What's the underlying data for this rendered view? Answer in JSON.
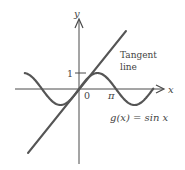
{
  "figure": {
    "colors": {
      "background": "#ffffff",
      "stroke": "#505050",
      "text": "#444444"
    }
  },
  "axes": {
    "x_label": "x",
    "y_label": "y",
    "origin_label": "0",
    "y_tick_label": "1",
    "x_tick_label": "π"
  },
  "annotations": {
    "tangent_line_1": "Tangent",
    "tangent_line_2": "line",
    "function_label": "g(x) = sin x"
  },
  "chart_data": {
    "type": "line",
    "title": "",
    "xlabel": "x",
    "ylabel": "y",
    "series": [
      {
        "name": "g(x) = sin x",
        "function": "sin(x)",
        "x_range": [
          -4.6,
          6.3
        ],
        "x": [
          -4.6,
          -3.14159,
          -1.5708,
          0,
          1.5708,
          3.14159,
          4.71239,
          6.2
        ],
        "y": [
          0.99,
          0,
          -1,
          0,
          1,
          0,
          -1,
          -0.08
        ]
      },
      {
        "name": "Tangent line",
        "function": "y = x",
        "x_range": [
          -4.3,
          3.8
        ],
        "x": [
          -4.3,
          3.8
        ],
        "y": [
          -4.0,
          3.6
        ]
      }
    ],
    "x_ticks": [
      {
        "value": 3.14159,
        "label": "π"
      }
    ],
    "y_ticks": [
      {
        "value": 1,
        "label": "1"
      }
    ],
    "origin_label": "0",
    "grid": false,
    "legend": "none"
  }
}
